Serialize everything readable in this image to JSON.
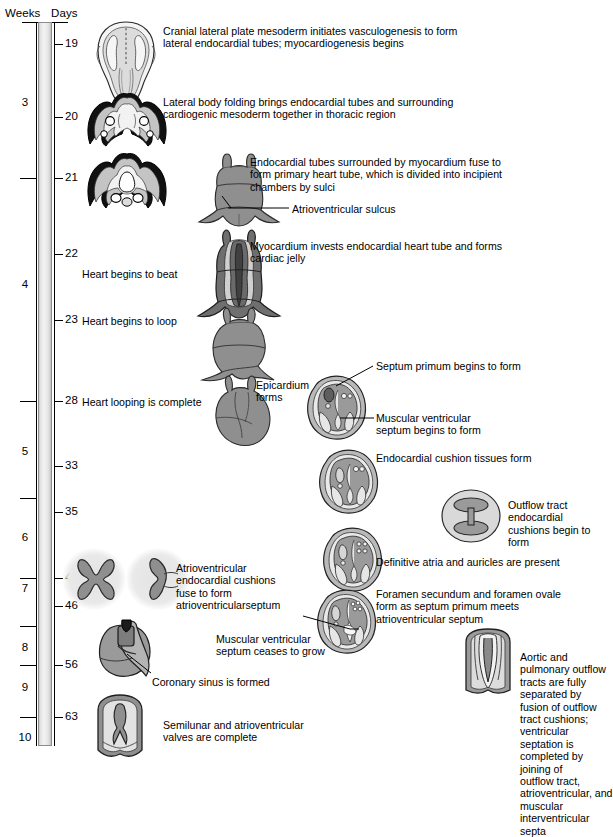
{
  "axis": {
    "weeks_header": "Weeks",
    "days_header": "Days",
    "weeks": [
      {
        "label": "3",
        "y": 103
      },
      {
        "label": "4",
        "y": 285
      },
      {
        "label": "5",
        "y": 452
      },
      {
        "label": "6",
        "y": 538
      },
      {
        "label": "7",
        "y": 589
      },
      {
        "label": "8",
        "y": 648
      },
      {
        "label": "9",
        "y": 688
      },
      {
        "label": "10",
        "y": 738
      }
    ],
    "week_ticks": [
      178,
      401,
      498,
      578,
      626,
      665,
      717
    ],
    "days": [
      {
        "label": "19",
        "y": 44
      },
      {
        "label": "20",
        "y": 117
      },
      {
        "label": "21",
        "y": 178
      },
      {
        "label": "22",
        "y": 254
      },
      {
        "label": "23",
        "y": 320
      },
      {
        "label": "28",
        "y": 401
      },
      {
        "label": "33",
        "y": 466
      },
      {
        "label": "35",
        "y": 512
      },
      {
        "label": "42",
        "y": 578
      },
      {
        "label": "46",
        "y": 606
      },
      {
        "label": "56",
        "y": 665
      },
      {
        "label": "63",
        "y": 717
      }
    ]
  },
  "annotations": {
    "a19": "Cranial lateral plate mesoderm initiates vasculogenesis to form\nlateral endocardial tubes; myocardiogenesis begins",
    "a20": "Lateral body folding brings endocardial tubes and surrounding\ncardiogenic mesoderm together in thoracic region",
    "a21": "Endocardial tubes surrounded by myocardium fuse to\nform primary heart tube, which is divided into incipient\nchambers by sulci",
    "av_sulcus": "Atrioventricular sulcus",
    "a22": "Myocardium invests endocardial heart tube and forms\ncardiac jelly",
    "beat": "Heart begins to beat",
    "loop": "Heart begins to loop",
    "loop_complete": "Heart looping is complete",
    "epicardium": "Epicardium\nforms",
    "septum_primum": "Septum primum begins to form",
    "muscular_vent_septum": "Muscular ventricular\nseptum begins to form",
    "endocardial_cushion": "Endocardial cushion tissues form",
    "outflow_tract": "Outflow tract endocardial\ncushions begin to form",
    "definitive_atria": "Definitive atria and auricles are present",
    "av_cushions_fuse": "Atrioventricular\nendocardial cushions\nfuse to form\natrioventricularseptum",
    "foramen": "Foramen secundum and foramen ovale\nform as septum primum meets\natrioventricular septum",
    "septum_ceases": "Muscular ventricular\nseptum ceases to grow",
    "coronary_sinus": "Coronary sinus is formed",
    "aortic_pulmonary": "Aortic and pulmonary outflow\ntracts are fully separated by\nfusion of outflow tract cushions;\nventricular septation is\ncompleted by joining of\noutflow tract, atrioventricular, and\nmuscular interventricular septa",
    "semilunar": "Semilunar and atrioventricular\nvalves are complete"
  },
  "colors": {
    "ink": "#000000",
    "bar_light": "#f2f2f2",
    "bar_dark": "#bdbdbd",
    "tissue_mid": "#8f8f8f",
    "tissue_light": "#c6c6c6",
    "tissue_dark": "#5a5a5a",
    "halo": "#e6e6e6"
  }
}
